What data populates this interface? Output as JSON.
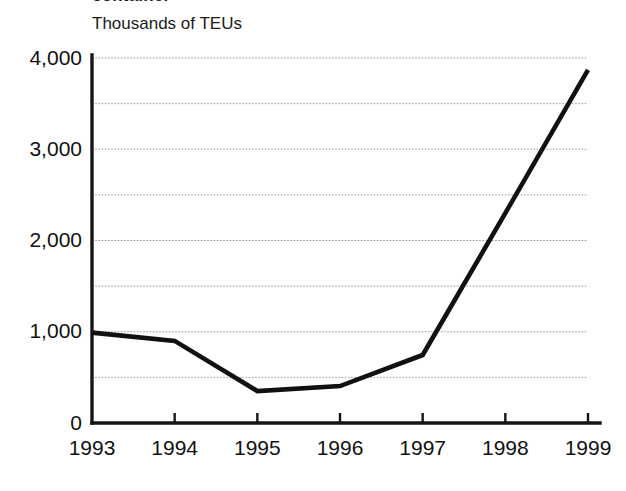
{
  "figure": {
    "title_fragment": "container",
    "unit_label": "Thousands of TEUs"
  },
  "chart_data": {
    "type": "line",
    "title": "",
    "subtitle": "",
    "xlabel": "",
    "ylabel": "Thousands of TEUs",
    "categories": [
      "1993",
      "1994",
      "1995",
      "1996",
      "1997",
      "1998",
      "1999"
    ],
    "x": [
      1993,
      1994,
      1995,
      1996,
      1997,
      1998,
      1999
    ],
    "values": [
      990,
      900,
      350,
      405,
      745,
      2300,
      3870
    ],
    "series": [
      {
        "name": "Thousands of TEUs",
        "values": [
          990,
          900,
          350,
          405,
          745,
          2300,
          3870
        ],
        "color": "#111111"
      }
    ],
    "ylim": [
      0,
      4000
    ],
    "xlim": [
      1993,
      1999
    ],
    "ytick_labels": [
      "0",
      "1,000",
      "2,000",
      "3,000",
      "4,000"
    ],
    "ytick_values": [
      0,
      1000,
      2000,
      3000,
      4000
    ],
    "minor_ytick_values": [
      500,
      1500,
      2500,
      3500
    ],
    "xtick_labels": [
      "1993",
      "1994",
      "1995",
      "1996",
      "1997",
      "1998",
      "1999"
    ],
    "grid": "horizontal-dotted",
    "minor_grid": true,
    "legend": "none",
    "annotations": []
  },
  "colors": {
    "line": "#111111",
    "grid": "#9a9a9a",
    "axis": "#161616",
    "background": "#ffffff",
    "text": "#111111"
  }
}
